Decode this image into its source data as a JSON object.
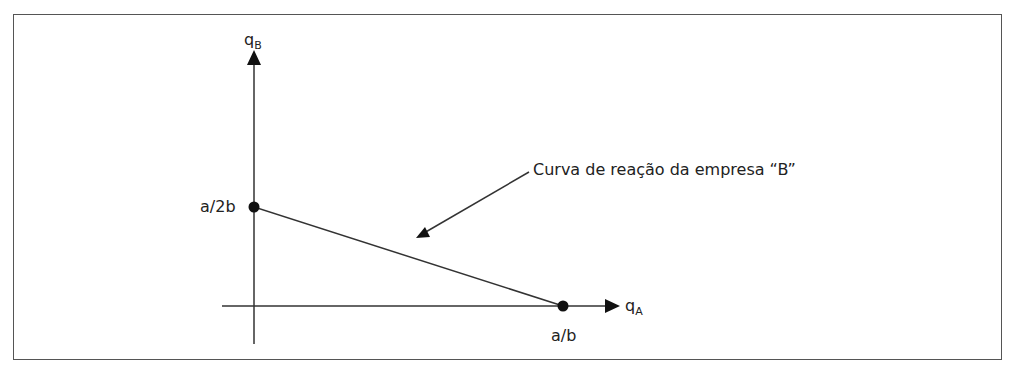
{
  "diagram": {
    "type": "reaction-curve",
    "y_axis": {
      "label": "q",
      "subscript": "B"
    },
    "x_axis": {
      "label": "q",
      "subscript": "A"
    },
    "points": [
      {
        "label": "a/2b",
        "axis": "y"
      },
      {
        "label": "a/b",
        "axis": "x"
      }
    ],
    "annotation": "Curva de reação da empresa “B”",
    "colors": {
      "line": "#333333",
      "text": "#222222",
      "border": "#555555"
    }
  }
}
